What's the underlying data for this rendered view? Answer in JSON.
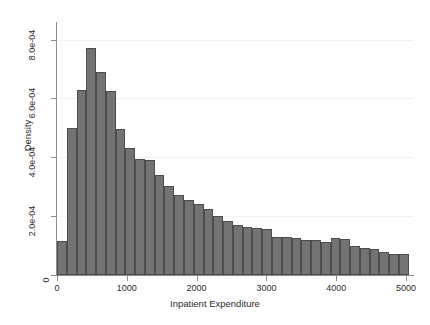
{
  "chart_data": {
    "type": "bar",
    "title": "",
    "subtitle": "",
    "xlabel": "Inpatient Expenditure",
    "ylabel": "Density",
    "xlim": [
      0,
      5100
    ],
    "ylim": [
      0,
      0.00086
    ],
    "grid": "horizontal-only",
    "legend": "none",
    "bin_width": 140,
    "bar_color": "#737373",
    "bar_edge_color": "#4d4d4d",
    "grid_color": "#f2f2f2",
    "axis_color": "#8c8c8c",
    "xticks": [
      0,
      1000,
      2000,
      3000,
      4000,
      5000
    ],
    "xtick_labels": [
      "0",
      "1000",
      "2000",
      "3000",
      "4000",
      "5000"
    ],
    "yticks": [
      0,
      0.0002,
      0.0004,
      0.0006,
      0.0008
    ],
    "ytick_labels": [
      "0",
      "2.0e-04",
      "4.0e-04",
      "6.0e-04",
      "8.0e-04"
    ],
    "bins": [
      {
        "x0": 0,
        "x1": 140,
        "density": 0.000115
      },
      {
        "x0": 140,
        "x1": 280,
        "density": 0.0005
      },
      {
        "x0": 280,
        "x1": 420,
        "density": 0.000628
      },
      {
        "x0": 420,
        "x1": 560,
        "density": 0.00077
      },
      {
        "x0": 560,
        "x1": 700,
        "density": 0.00069
      },
      {
        "x0": 700,
        "x1": 840,
        "density": 0.000625
      },
      {
        "x0": 840,
        "x1": 980,
        "density": 0.000498
      },
      {
        "x0": 980,
        "x1": 1120,
        "density": 0.000432
      },
      {
        "x0": 1120,
        "x1": 1260,
        "density": 0.000395
      },
      {
        "x0": 1260,
        "x1": 1400,
        "density": 0.00039
      },
      {
        "x0": 1400,
        "x1": 1540,
        "density": 0.00034
      },
      {
        "x0": 1540,
        "x1": 1680,
        "density": 0.000302
      },
      {
        "x0": 1680,
        "x1": 1820,
        "density": 0.000272
      },
      {
        "x0": 1820,
        "x1": 1960,
        "density": 0.000255
      },
      {
        "x0": 1960,
        "x1": 2100,
        "density": 0.00024
      },
      {
        "x0": 2100,
        "x1": 2240,
        "density": 0.000225
      },
      {
        "x0": 2240,
        "x1": 2380,
        "density": 0.0002
      },
      {
        "x0": 2380,
        "x1": 2520,
        "density": 0.000183
      },
      {
        "x0": 2520,
        "x1": 2660,
        "density": 0.00017
      },
      {
        "x0": 2660,
        "x1": 2800,
        "density": 0.000163
      },
      {
        "x0": 2800,
        "x1": 2940,
        "density": 0.00016
      },
      {
        "x0": 2940,
        "x1": 3080,
        "density": 0.000157
      },
      {
        "x0": 3080,
        "x1": 3220,
        "density": 0.00013
      },
      {
        "x0": 3220,
        "x1": 3360,
        "density": 0.000128
      },
      {
        "x0": 3360,
        "x1": 3500,
        "density": 0.000125
      },
      {
        "x0": 3500,
        "x1": 3640,
        "density": 0.00012
      },
      {
        "x0": 3640,
        "x1": 3780,
        "density": 0.000118
      },
      {
        "x0": 3780,
        "x1": 3920,
        "density": 0.000112
      },
      {
        "x0": 3920,
        "x1": 4060,
        "density": 0.000125
      },
      {
        "x0": 4060,
        "x1": 4200,
        "density": 0.000122
      },
      {
        "x0": 4200,
        "x1": 4340,
        "density": 9.8e-05
      },
      {
        "x0": 4340,
        "x1": 4480,
        "density": 9.2e-05
      },
      {
        "x0": 4480,
        "x1": 4620,
        "density": 9e-05
      },
      {
        "x0": 4620,
        "x1": 4760,
        "density": 7.8e-05
      },
      {
        "x0": 4760,
        "x1": 4900,
        "density": 7.3e-05
      },
      {
        "x0": 4900,
        "x1": 5040,
        "density": 7e-05
      }
    ]
  }
}
